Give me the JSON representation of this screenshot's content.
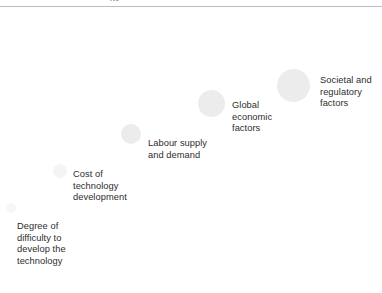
{
  "figure": {
    "title_fragment": "gy",
    "rule_color": "#b9bcc0",
    "background": "#ffffff",
    "text_color": "#2d2d2d",
    "bubble_color": "#ececec"
  },
  "chart_data": {
    "type": "scatter",
    "title": "",
    "subtitle": "",
    "xlabel": "",
    "ylabel": "",
    "grid": false,
    "legend": "none",
    "note": "Bubble chart: five factors plotted along an ascending diagonal, bubble area grows left-to-right indicating increasing magnitude/importance.",
    "categories": [
      "Degree of difficulty to develop the technology",
      "Cost of technology development",
      "Labour supply and demand",
      "Global economic factors",
      "Societal and regulatory factors"
    ],
    "points": [
      {
        "label": "Degree of difficulty to develop the technology",
        "label_lines": "Degree of\ndifficulty to\ndevelop the\ntechnology",
        "x": 11,
        "y": 208,
        "r": 5,
        "size_rank": 1,
        "opacity": "faintest",
        "label_x": 17,
        "label_y": 221
      },
      {
        "label": "Cost of technology development",
        "label_lines": "Cost of\ntechnology\ndevelopment",
        "x": 60,
        "y": 171,
        "r": 7,
        "size_rank": 2,
        "opacity": "faint",
        "label_x": 73,
        "label_y": 169
      },
      {
        "label": "Labour supply and demand",
        "label_lines": "Labour supply\nand demand",
        "x": 131,
        "y": 134,
        "r": 10,
        "size_rank": 3,
        "opacity": "normal",
        "label_x": 148,
        "label_y": 138
      },
      {
        "label": "Global economic factors",
        "label_lines": "Global\neconomic\nfactors",
        "x": 211,
        "y": 103,
        "r": 13.5,
        "size_rank": 4,
        "opacity": "normal",
        "label_x": 232,
        "label_y": 100
      },
      {
        "label": "Societal and regulatory factors",
        "label_lines": "Societal and\nregulatory\nfactors",
        "x": 293,
        "y": 85,
        "r": 16.5,
        "size_rank": 5,
        "opacity": "normal",
        "label_x": 320,
        "label_y": 75
      }
    ]
  }
}
